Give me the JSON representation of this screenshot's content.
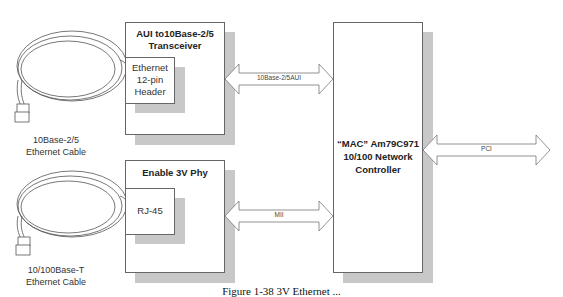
{
  "diagram": {
    "blocks": {
      "aui_transceiver": {
        "title_line1": "AUI to10Base-2/5",
        "title_line2": "Transceiver",
        "inner": {
          "line1": "Ethernet",
          "line2": "12-pin",
          "line3": "Header"
        }
      },
      "phy": {
        "title": "Enable 3V Phy",
        "inner": {
          "line1": "RJ-45"
        }
      },
      "mac": {
        "line1": "“MAC” Am79C971",
        "line2": "10/100 Network",
        "line3": "Controller"
      }
    },
    "cables": [
      {
        "line1": "10Base-2/5",
        "line2": "Ethernet Cable"
      },
      {
        "line1": "10/100Base-T",
        "line2": "Ethernet Cable"
      }
    ],
    "arrows": {
      "aui": "10Base-2/5AUI",
      "mii": "MII",
      "pci": "PCI"
    },
    "caption": "Figure 1-38   3V Ethernet ..."
  }
}
